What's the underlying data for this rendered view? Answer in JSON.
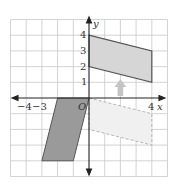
{
  "axes": {
    "x_label": "x",
    "y_label": "y",
    "origin_label": "O",
    "x_ticks": [
      "−4",
      "−3",
      "4"
    ],
    "y_ticks": [
      "4",
      "3",
      "2",
      "1"
    ]
  },
  "colors": {
    "grid": "#c8c8c8",
    "axis": "#333333",
    "image_fill": "#d6d6d6",
    "image_stroke": "#555555",
    "preimage_fill": "#9a9a9a",
    "dashed_stroke": "#bbbbbb",
    "dashed_fill": "#f0f0f0",
    "arrow": "#c0c0c0"
  },
  "shapes": {
    "translated_image": {
      "vertices": [
        [
          0,
          4
        ],
        [
          4,
          3
        ],
        [
          4,
          1
        ],
        [
          0,
          2
        ]
      ],
      "style": "solid-shaded"
    },
    "original_figure": {
      "vertices": [
        [
          -2,
          0
        ],
        [
          0,
          0
        ],
        [
          -1,
          -4
        ],
        [
          -3,
          -4
        ]
      ],
      "style": "dark-shaded"
    },
    "intermediate_figure": {
      "vertices": [
        [
          0,
          0
        ],
        [
          4,
          -1
        ],
        [
          4,
          -3
        ],
        [
          0,
          -2
        ]
      ],
      "style": "dashed-light"
    }
  },
  "arrow": {
    "from": [
      2,
      0.2
    ],
    "to": [
      2,
      1
    ],
    "direction": "up"
  }
}
